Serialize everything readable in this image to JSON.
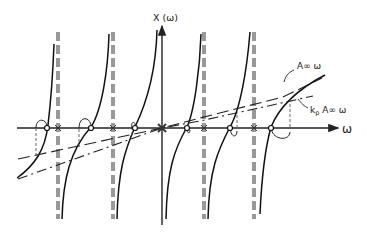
{
  "diagram": {
    "type": "reactance-function-sketch",
    "vertical_axis_label": "X (ω)",
    "horizontal_axis_label": "ω",
    "line_labels": {
      "upper_line": "A∞ ω",
      "lower_line_prefix": "k",
      "lower_line_subscript": "p",
      "lower_line_suffix": " A∞ ω"
    },
    "poles_marked": 4,
    "zeros_marked": 6,
    "origin_marker": "x"
  }
}
